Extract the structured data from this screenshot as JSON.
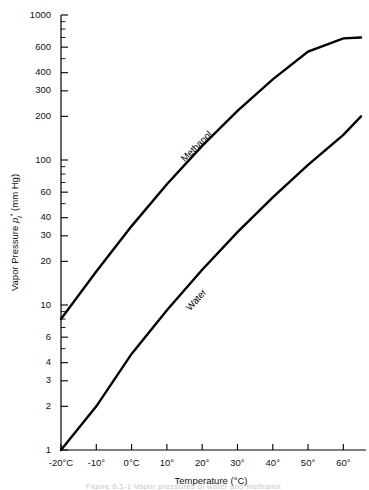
{
  "figure": {
    "caption": "Figure 6.1-1   Vapor pressures of water and methanol.",
    "background": "#ffffff",
    "line_color": "#000000"
  },
  "chart_data": {
    "type": "line",
    "title": "",
    "xlabel": "Temperature (°C)",
    "ylabel_text": "Vapor Pressure",
    "ylabel_symbol": "p",
    "ylabel_symbol_sub": "i",
    "ylabel_symbol_sup": "*",
    "ylabel_units": "(mm Hg)",
    "yscale": "log",
    "xscale": "linear",
    "ylim": [
      1,
      1000
    ],
    "xlim": [
      -20,
      65
    ],
    "grid": false,
    "legend": "inline-labels",
    "ytick_labels": [
      "1",
      "2",
      "3",
      "4",
      "6",
      "10",
      "20",
      "30",
      "40",
      "60",
      "100",
      "200",
      "300",
      "400",
      "600",
      "1000"
    ],
    "ytick_values": [
      1,
      2,
      3,
      4,
      6,
      10,
      20,
      30,
      40,
      60,
      100,
      200,
      300,
      400,
      600,
      1000
    ],
    "yminor_values": [
      5,
      7,
      8,
      9,
      50,
      70,
      80,
      90,
      500,
      700,
      800,
      900
    ],
    "xtick_labels": [
      "-20°C",
      "-10°",
      "0°C",
      "10°",
      "20°",
      "30°",
      "40°",
      "50°",
      "60°"
    ],
    "xtick_values": [
      -20,
      -10,
      0,
      10,
      20,
      30,
      40,
      50,
      60
    ],
    "series": [
      {
        "name": "Methanol",
        "label": "Methanol",
        "label_at": {
          "x": 19.0,
          "y": 120
        },
        "x": [
          -20,
          -10,
          0,
          10,
          20,
          30,
          40,
          50,
          60,
          65
        ],
        "y": [
          8.0,
          17.0,
          35.0,
          68.0,
          125.0,
          218.0,
          360.0,
          560.0,
          690.0,
          700.0
        ]
      },
      {
        "name": "Water",
        "label": "Water",
        "label_at": {
          "x": 19.0,
          "y": 10.5
        },
        "x": [
          -20,
          -10,
          0,
          10,
          20,
          30,
          40,
          50,
          60,
          65
        ],
        "y": [
          1.0,
          2.0,
          4.6,
          9.2,
          17.5,
          31.8,
          55.3,
          92.5,
          149.0,
          200.0
        ]
      }
    ]
  }
}
